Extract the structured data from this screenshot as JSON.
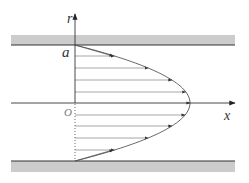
{
  "diagram": {
    "labels": {
      "r_axis": "r",
      "x_axis": "x",
      "wall_half_width": "a",
      "origin": "O"
    },
    "colors": {
      "wall_fill": "#c8c8c8",
      "wall_edge": "#3a3a3a",
      "axis": "#444444",
      "vector_lines": "#8a8a8a",
      "profile_curve": "#555555"
    },
    "geometry": {
      "axis_x": 75,
      "centerline_y": 103,
      "top_wall_y": 45,
      "bottom_wall_y": 161,
      "vertex_x": 190,
      "velocity_line_ys": [
        56,
        68,
        80,
        92,
        103,
        115,
        126,
        138,
        150
      ]
    }
  }
}
